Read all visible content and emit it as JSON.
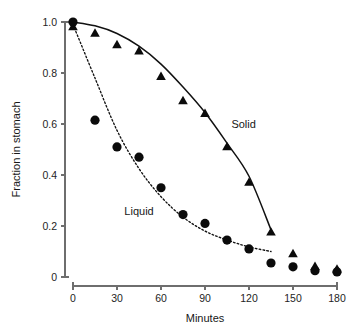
{
  "chart_data": {
    "type": "scatter",
    "title": "",
    "xlabel": "Minutes",
    "ylabel": "Fraction in stomach",
    "xlim": [
      0,
      180
    ],
    "ylim": [
      0,
      1.0
    ],
    "xticks": [
      0,
      30,
      60,
      90,
      120,
      150,
      180
    ],
    "xtick_labels": [
      "0",
      "30",
      "60",
      "90",
      "120",
      "150",
      "180"
    ],
    "yticks": [
      0,
      0.2,
      0.4,
      0.6,
      0.8,
      1.0
    ],
    "ytick_labels": [
      "0",
      "0.2",
      "0.4",
      "0.6",
      "0.8",
      "1.0"
    ],
    "grid": false,
    "legend_position": "inline-annotations",
    "x": [
      0,
      15,
      30,
      45,
      60,
      75,
      90,
      105,
      120,
      135,
      150,
      165,
      180
    ],
    "series": [
      {
        "name": "Solid",
        "marker": "triangle",
        "color": "#0b0b0b",
        "fit_line_style": "solid",
        "annotation": "Solid",
        "annotation_x": 108,
        "annotation_y": 0.585,
        "values": [
          0.98,
          0.955,
          0.91,
          0.885,
          0.785,
          0.69,
          0.64,
          0.51,
          0.37,
          0.175,
          0.09,
          0.04,
          0.03
        ],
        "fit_x": [
          0,
          15,
          30,
          45,
          60,
          75,
          90,
          105,
          120,
          135
        ],
        "fit_y": [
          1.0,
          0.985,
          0.955,
          0.905,
          0.835,
          0.745,
          0.645,
          0.525,
          0.395,
          0.185
        ]
      },
      {
        "name": "Liquid",
        "marker": "circle",
        "color": "#0b0b0b",
        "fit_line_style": "dotted",
        "annotation": "Liquid",
        "annotation_x": 35,
        "annotation_y": 0.245,
        "values": [
          1.0,
          0.615,
          0.51,
          0.47,
          0.35,
          0.245,
          0.21,
          0.145,
          0.11,
          0.055,
          0.04,
          0.025,
          0.02
        ],
        "fit_x": [
          0,
          15,
          30,
          45,
          60,
          75,
          90,
          105,
          120,
          135
        ],
        "fit_y": [
          0.99,
          0.78,
          0.575,
          0.425,
          0.315,
          0.235,
          0.18,
          0.145,
          0.118,
          0.1
        ]
      }
    ]
  },
  "axes": {
    "x_title": "Minutes",
    "y_title": "Fraction in stomach"
  },
  "annotations": {
    "solid": "Solid",
    "liquid": "Liquid"
  }
}
